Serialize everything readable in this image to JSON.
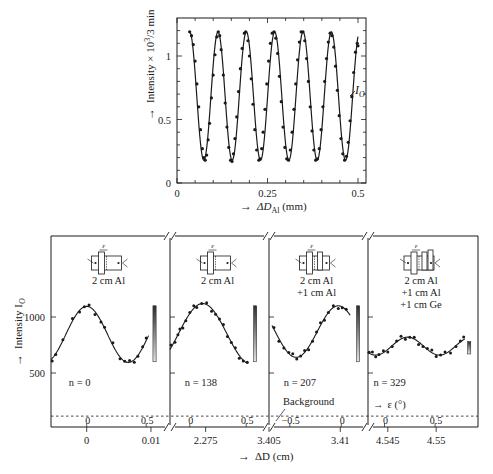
{
  "chart_data": [
    {
      "id": "top",
      "type": "line",
      "title": "",
      "xlabel": "→ ΔD_Al (mm)",
      "xlabel_main": "ΔD",
      "xlabel_sub": "Al",
      "xlabel_unit": "(mm)",
      "ylabel": "→ Intensity × 10³/3 min",
      "xlim": [
        0,
        0.52
      ],
      "ylim": [
        0,
        1.3
      ],
      "xticks": [
        0,
        0.25,
        0.5
      ],
      "xtick_labels": [
        "0",
        "0.25",
        "0.5"
      ],
      "yticks": [
        0,
        0.5,
        1
      ],
      "ytick_labels": [
        "0",
        "0.5",
        "1"
      ],
      "grid": false,
      "legend": [],
      "annotation": "I_O",
      "curve": {
        "model": "sinusoid",
        "mean": 0.685,
        "amplitude": 0.505,
        "period_mm": 0.0783,
        "first_max_x": 0.035,
        "x_range": [
          0.035,
          0.5
        ]
      },
      "series": [
        {
          "name": "I_O",
          "x": [
            0.035,
            0.04,
            0.045,
            0.05,
            0.055,
            0.06,
            0.065,
            0.07,
            0.074,
            0.078,
            0.082,
            0.086,
            0.09,
            0.095,
            0.1,
            0.105,
            0.11,
            0.114,
            0.118,
            0.122,
            0.128,
            0.133,
            0.138,
            0.143,
            0.148,
            0.152,
            0.156,
            0.16,
            0.165,
            0.17,
            0.175,
            0.18,
            0.186,
            0.19,
            0.196,
            0.2,
            0.205,
            0.21,
            0.215,
            0.22,
            0.226,
            0.23,
            0.234,
            0.238,
            0.243,
            0.248,
            0.253,
            0.258,
            0.263,
            0.268,
            0.273,
            0.278,
            0.283,
            0.288,
            0.293,
            0.298,
            0.303,
            0.308,
            0.313,
            0.318,
            0.323,
            0.328,
            0.333,
            0.338,
            0.343,
            0.348,
            0.353,
            0.358,
            0.363,
            0.368,
            0.373,
            0.378,
            0.383,
            0.388,
            0.393,
            0.398,
            0.403,
            0.408,
            0.413,
            0.418,
            0.423,
            0.428,
            0.433,
            0.438,
            0.443,
            0.448,
            0.453,
            0.458,
            0.463,
            0.468,
            0.473,
            0.478,
            0.483,
            0.488,
            0.493,
            0.498,
            0.5
          ],
          "y": [
            1.19,
            1.16,
            1.09,
            0.96,
            0.78,
            0.6,
            0.42,
            0.27,
            0.2,
            0.18,
            0.22,
            0.34,
            0.47,
            0.67,
            0.85,
            1.01,
            1.15,
            1.19,
            1.16,
            1.05,
            0.85,
            0.63,
            0.44,
            0.28,
            0.18,
            0.17,
            0.23,
            0.35,
            0.52,
            0.72,
            0.9,
            1.06,
            1.18,
            1.19,
            1.12,
            1.0,
            0.82,
            0.62,
            0.42,
            0.26,
            0.18,
            0.19,
            0.27,
            0.4,
            0.58,
            0.78,
            0.96,
            1.1,
            1.18,
            1.19,
            1.14,
            1.02,
            0.84,
            0.64,
            0.44,
            0.28,
            0.19,
            0.18,
            0.26,
            0.4,
            0.58,
            0.78,
            0.97,
            1.11,
            1.19,
            1.19,
            1.12,
            0.98,
            0.8,
            0.6,
            0.41,
            0.26,
            0.18,
            0.19,
            0.27,
            0.42,
            0.6,
            0.8,
            0.98,
            1.11,
            1.18,
            1.16,
            1.07,
            0.92,
            0.73,
            0.53,
            0.35,
            0.23,
            0.18,
            0.21,
            0.32,
            0.49,
            0.68,
            0.87,
            1.03,
            1.1,
            1.08
          ]
        }
      ]
    },
    {
      "id": "bottom",
      "type": "line",
      "title": "",
      "xlabel": "→ ΔD (cm)",
      "ylabel": "→ Intensity I_O",
      "ylim": [
        0,
        1700
      ],
      "yticks": [
        500,
        1000
      ],
      "ytick_labels": [
        "500",
        "1000"
      ],
      "background_level": 115,
      "background_label": "Background",
      "epsilon_label": "→ ε (°)",
      "grid": false,
      "panels": [
        {
          "n_label": "n = 0",
          "n": 0,
          "setup_lines": [
            "2 cm Al"
          ],
          "outer_ticks": [
            {
              "label": "0",
              "pos": 0.3
            },
            {
              "label": "0.01",
              "pos": 0.84
            }
          ],
          "inner_ticks": [
            {
              "label": "0",
              "pos": 0.3
            },
            {
              "label": "0.5",
              "pos": 0.8
            }
          ],
          "curve": {
            "mean": 845,
            "amplitude": 250,
            "phase_peak_frac": 0.3,
            "period_frac": 0.7,
            "range": [
              0.0,
              0.82
            ]
          },
          "points_frac": [
            0.01,
            0.04,
            0.1,
            0.18,
            0.24,
            0.28,
            0.32,
            0.37,
            0.42,
            0.45,
            0.52,
            0.58,
            0.62,
            0.66,
            0.7,
            0.73,
            0.77,
            0.8
          ],
          "bar": {
            "pos": 0.87,
            "top": 1100,
            "bottom": 600
          }
        },
        {
          "n_label": "n = 138",
          "n": 138,
          "setup_lines": [
            "2 cm Al"
          ],
          "outer_ticks": [
            {
              "label": "2.275",
              "pos": 0.36
            }
          ],
          "inner_ticks": [
            {
              "label": "0",
              "pos": 0.2
            },
            {
              "label": "0.5",
              "pos": 0.77
            }
          ],
          "curve": {
            "mean": 850,
            "amplitude": 270,
            "phase_peak_frac": 0.33,
            "period_frac": 0.98,
            "range": [
              0.0,
              0.79
            ]
          },
          "points_frac": [
            0.01,
            0.05,
            0.08,
            0.1,
            0.13,
            0.16,
            0.2,
            0.24,
            0.27,
            0.32,
            0.37,
            0.42,
            0.46,
            0.5,
            0.54,
            0.58,
            0.62,
            0.66,
            0.7,
            0.74,
            0.78
          ],
          "bar": {
            "pos": 0.86,
            "top": 1100,
            "bottom": 600
          }
        },
        {
          "n_label": "n = 207",
          "n": 207,
          "setup_lines": [
            "2 cm Al",
            "+1 cm Al"
          ],
          "outer_ticks": [
            {
              "label": "3.405",
              "pos": 0.0
            },
            {
              "label": "3.41",
              "pos": 0.72
            }
          ],
          "inner_ticks": [
            {
              "label": "−0.5",
              "pos": 0.21
            },
            {
              "label": "0",
              "pos": 0.73
            }
          ],
          "curve": {
            "mean": 870,
            "amplitude": 230,
            "phase_peak_frac": 0.7,
            "period_frac": 0.85,
            "range": [
              0.03,
              0.82
            ]
          },
          "points_frac": [
            0.05,
            0.1,
            0.15,
            0.2,
            0.24,
            0.28,
            0.32,
            0.36,
            0.4,
            0.44,
            0.48,
            0.52,
            0.56,
            0.6,
            0.65,
            0.7,
            0.74,
            0.78
          ],
          "bar": {
            "pos": 0.9,
            "top": 1100,
            "bottom": 600
          }
        },
        {
          "n_label": "n = 329",
          "n": 329,
          "setup_lines": [
            "2 cm Al",
            "+1 cm Al",
            "+1 cm Ge"
          ],
          "outer_ticks": [
            {
              "label": "4.545",
              "pos": 0.18
            },
            {
              "label": "4.55",
              "pos": 0.62
            }
          ],
          "inner_ticks": [
            {
              "label": "0",
              "pos": 0.15
            },
            {
              "label": "0.5",
              "pos": 0.61
            }
          ],
          "curve": {
            "mean": 740,
            "amplitude": 80,
            "phase_peak_frac": 0.36,
            "period_frac": 0.58,
            "range": [
              0.0,
              0.88
            ]
          },
          "points_frac": [
            0.01,
            0.04,
            0.07,
            0.1,
            0.14,
            0.18,
            0.22,
            0.26,
            0.3,
            0.34,
            0.38,
            0.42,
            0.46,
            0.5,
            0.54,
            0.58,
            0.62,
            0.66,
            0.7,
            0.75,
            0.8,
            0.84,
            0.87
          ],
          "bar": {
            "pos": 0.92,
            "top": 780,
            "bottom": 670
          }
        }
      ]
    }
  ],
  "labels": {
    "top_y_axis": "Intensity × 10",
    "top_y_axis_sup": "3",
    "top_y_axis_tail": "/3 min",
    "top_x_axis": "ΔD",
    "top_x_axis_sub": "Al",
    "top_x_axis_unit": " (mm)",
    "top_curve_label": "I",
    "top_curve_label_sub": "O",
    "bottom_y_axis": "Intensity I",
    "bottom_y_axis_sub": "O",
    "bottom_x_axis": "ΔD (cm)",
    "background": "Background",
    "epsilon": "ε (°)",
    "epsilon_symbol": "ε",
    "arrow": "→"
  },
  "colors": {
    "ink": "#1a1a1a",
    "bar_light": "#d8d8d8",
    "bar_dark": "#3a3a3a",
    "background": "#ffffff"
  }
}
